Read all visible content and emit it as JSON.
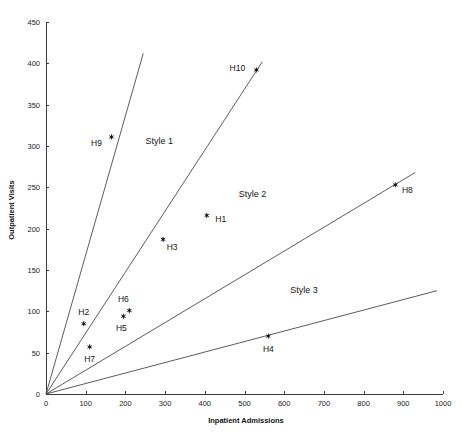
{
  "chart_data": {
    "type": "scatter",
    "title": "",
    "xlabel": "Inpatient Admissions",
    "ylabel": "Outpatient Visits",
    "xlim": [
      0,
      1000
    ],
    "ylim": [
      0,
      450
    ],
    "grid": false,
    "legend": "none",
    "xticks": [
      0,
      100,
      200,
      300,
      400,
      500,
      600,
      700,
      800,
      900,
      1000
    ],
    "yticks": [
      0,
      50,
      100,
      150,
      200,
      250,
      300,
      350,
      400,
      450
    ],
    "xtick_labels": [
      "0",
      "100",
      "200",
      "300",
      "400",
      "500",
      "600",
      "700",
      "800",
      "900",
      "1000"
    ],
    "ytick_labels": [
      "0",
      "50",
      "100",
      "150",
      "200",
      "250",
      "300",
      "350",
      "400",
      "450"
    ],
    "points": [
      {
        "label": "H1",
        "x": 405,
        "y": 216,
        "label_dx": 14,
        "label_dy": 7
      },
      {
        "label": "H2",
        "x": 95,
        "y": 85,
        "label_dx": 0,
        "label_dy": -9
      },
      {
        "label": "H3",
        "x": 295,
        "y": 187,
        "label_dx": 9,
        "label_dy": 11
      },
      {
        "label": "H4",
        "x": 560,
        "y": 70,
        "label_dx": 0,
        "label_dy": 16
      },
      {
        "label": "H5",
        "x": 195,
        "y": 94,
        "label_dx": -2,
        "label_dy": 15
      },
      {
        "label": "H6",
        "x": 210,
        "y": 101,
        "label_dx": -6,
        "label_dy": -9
      },
      {
        "label": "H7",
        "x": 110,
        "y": 57,
        "label_dx": 0,
        "label_dy": 15
      },
      {
        "label": "H8",
        "x": 880,
        "y": 253,
        "label_dx": 12,
        "label_dy": 8
      },
      {
        "label": "H9",
        "x": 165,
        "y": 311,
        "label_dx": -15,
        "label_dy": 9
      },
      {
        "label": "H10",
        "x": 530,
        "y": 392,
        "label_dx": -19,
        "label_dy": 1
      }
    ],
    "rays": [
      {
        "name": "ray-style1-boundary-upper",
        "x_end": 245,
        "y_end": 412
      },
      {
        "name": "ray-style1-style2-boundary",
        "x_end": 545,
        "y_end": 402
      },
      {
        "name": "ray-style2-style3-boundary",
        "x_end": 930,
        "y_end": 268
      },
      {
        "name": "ray-style3-boundary-lower",
        "x_end": 985,
        "y_end": 125
      }
    ],
    "annotations": [
      {
        "label": "Style 1",
        "x": 285,
        "y": 302
      },
      {
        "label": "Style 2",
        "x": 520,
        "y": 238
      },
      {
        "label": "Style 3",
        "x": 650,
        "y": 122
      }
    ]
  }
}
